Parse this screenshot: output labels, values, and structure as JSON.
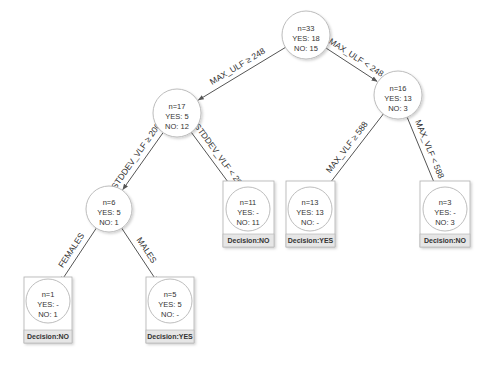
{
  "diagram": {
    "type": "decision-tree",
    "colors": {
      "line": "#555555",
      "circle_stroke": "#b5b5b5",
      "box_stroke": "#b0b0b0",
      "decision_fill": "#e6e6e6",
      "text": "#333333"
    },
    "nodes": [
      {
        "id": "root",
        "n": "n=33",
        "yes": "YES: 18",
        "no": "NO: 15",
        "leaf": false
      },
      {
        "id": "n17",
        "n": "n=17",
        "yes": "YES: 5",
        "no": "NO: 12",
        "leaf": false
      },
      {
        "id": "n16",
        "n": "n=16",
        "yes": "YES: 13",
        "no": "NO: 3",
        "leaf": false
      },
      {
        "id": "n6",
        "n": "n=6",
        "yes": "YES: 5",
        "no": "NO: 1",
        "leaf": false
      },
      {
        "id": "n11",
        "n": "n=11",
        "yes": "YES: -",
        "no": "NO: 11",
        "leaf": true,
        "decision": "Decision:NO"
      },
      {
        "id": "n13",
        "n": "n=13",
        "yes": "YES: 13",
        "no": "NO: -",
        "leaf": true,
        "decision": "Decision:YES"
      },
      {
        "id": "n3",
        "n": "n=3",
        "yes": "YES: -",
        "no": "NO: 3",
        "leaf": true,
        "decision": "Decision:NO"
      },
      {
        "id": "n1",
        "n": "n=1",
        "yes": "YES: -",
        "no": "NO: 1",
        "leaf": true,
        "decision": "Decision:NO"
      },
      {
        "id": "n5",
        "n": "n=5",
        "yes": "YES: 5",
        "no": "NO: -",
        "leaf": true,
        "decision": "Decision:YES"
      }
    ],
    "edges": [
      {
        "from": "root",
        "to": "n17",
        "label": "MAX_ULF ≥ 248"
      },
      {
        "from": "root",
        "to": "n16",
        "label": "MAX_ULF < 248"
      },
      {
        "from": "n17",
        "to": "n6",
        "label": "STDDEV_VLF ≥ 200"
      },
      {
        "from": "n17",
        "to": "n11",
        "label": "STDDEV_VLF < 200"
      },
      {
        "from": "n16",
        "to": "n13",
        "label": "MAX_VLF ≥ 588"
      },
      {
        "from": "n16",
        "to": "n3",
        "label": "MAX_VLF < 588"
      },
      {
        "from": "n6",
        "to": "n1",
        "label": "FEMALES"
      },
      {
        "from": "n6",
        "to": "n5",
        "label": "MALES"
      }
    ]
  }
}
